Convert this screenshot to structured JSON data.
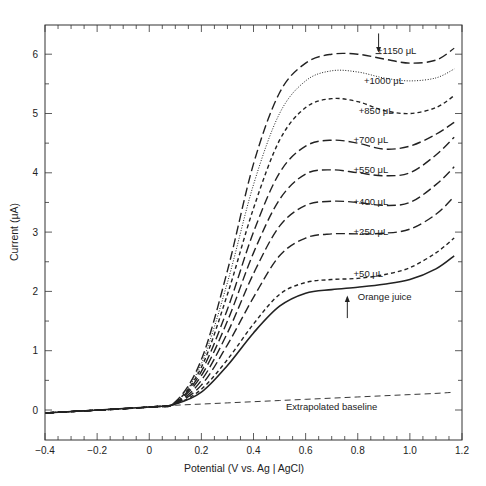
{
  "chart_data": {
    "type": "line",
    "title": "",
    "xlabel": "Potential (V vs. Ag | AgCl)",
    "ylabel": "Current (μA)",
    "xlim": [
      -0.4,
      1.2
    ],
    "ylim": [
      -0.35,
      6.45
    ],
    "xticks": [
      "-0.4",
      "-0.2",
      "0",
      "0.2",
      "0.4",
      "0.6",
      "0.8",
      "1.0",
      "1.2"
    ],
    "yticks": [
      "0",
      "1",
      "2",
      "3",
      "4",
      "5",
      "6"
    ],
    "grid": false,
    "x": [
      -0.4,
      0.0,
      0.1,
      0.2,
      0.3,
      0.4,
      0.5,
      0.6,
      0.7,
      0.8,
      0.9,
      1.0,
      1.1,
      1.17
    ],
    "series": [
      {
        "name": "Orange juice",
        "style": "solid",
        "values": [
          -0.05,
          0.05,
          0.1,
          0.3,
          0.75,
          1.3,
          1.75,
          1.97,
          2.03,
          2.07,
          2.12,
          2.2,
          2.38,
          2.6
        ]
      },
      {
        "name": "+50 μL",
        "style": "short-dash",
        "values": [
          -0.05,
          0.05,
          0.1,
          0.35,
          0.85,
          1.45,
          1.95,
          2.15,
          2.2,
          2.22,
          2.28,
          2.4,
          2.65,
          2.9
        ]
      },
      {
        "name": "+250 μL",
        "style": "long-dash",
        "values": [
          -0.05,
          0.05,
          0.11,
          0.42,
          1.1,
          1.9,
          2.6,
          2.9,
          2.97,
          2.97,
          2.98,
          3.05,
          3.3,
          3.6
        ]
      },
      {
        "name": "+400 μL",
        "style": "long-dash",
        "values": [
          -0.05,
          0.05,
          0.11,
          0.5,
          1.3,
          2.3,
          3.1,
          3.45,
          3.52,
          3.5,
          3.45,
          3.5,
          3.8,
          4.1
        ]
      },
      {
        "name": "+550 μL",
        "style": "long-dash",
        "values": [
          -0.05,
          0.05,
          0.12,
          0.58,
          1.5,
          2.65,
          3.55,
          3.98,
          4.05,
          4.0,
          3.95,
          4.0,
          4.3,
          4.6
        ]
      },
      {
        "name": "+700 μL",
        "style": "long-dash",
        "values": [
          -0.05,
          0.05,
          0.12,
          0.65,
          1.7,
          3.0,
          4.0,
          4.45,
          4.55,
          4.5,
          4.4,
          4.45,
          4.65,
          4.85
        ]
      },
      {
        "name": "+850 μL",
        "style": "short-dash",
        "values": [
          -0.05,
          0.05,
          0.13,
          0.72,
          1.95,
          3.4,
          4.55,
          5.1,
          5.25,
          5.2,
          5.05,
          5.0,
          5.1,
          5.3
        ]
      },
      {
        "name": "+1000 μL",
        "style": "dotted",
        "values": [
          -0.05,
          0.05,
          0.13,
          0.78,
          2.15,
          3.8,
          5.0,
          5.55,
          5.72,
          5.7,
          5.6,
          5.55,
          5.6,
          5.75
        ]
      },
      {
        "name": "+1150 μL",
        "style": "long-dash",
        "values": [
          -0.05,
          0.05,
          0.14,
          0.85,
          2.35,
          4.15,
          5.35,
          5.85,
          6.0,
          6.0,
          5.92,
          5.85,
          5.9,
          6.1
        ]
      },
      {
        "name": "Extrapolated baseline",
        "style": "dashed",
        "values": [
          -0.05,
          0.05,
          0.08,
          0.1,
          0.12,
          0.14,
          0.16,
          0.18,
          0.2,
          0.22,
          0.24,
          0.26,
          0.28,
          0.3
        ]
      }
    ],
    "annotations": [
      {
        "text": "+1150 μL",
        "x": 0.92,
        "y": 6.05,
        "arrow": "down at 0.88"
      },
      {
        "text": "+1000 μL",
        "x": 0.87,
        "y": 5.55
      },
      {
        "text": "+850 μL",
        "x": 0.85,
        "y": 5.05
      },
      {
        "text": "+700 μL",
        "x": 0.83,
        "y": 4.55
      },
      {
        "text": "+550 μL",
        "x": 0.83,
        "y": 4.05
      },
      {
        "text": "+400 μL",
        "x": 0.83,
        "y": 3.5
      },
      {
        "text": "+250 μL",
        "x": 0.83,
        "y": 3.0
      },
      {
        "text": "+50 μL",
        "x": 0.83,
        "y": 2.3
      },
      {
        "text": "Orange juice",
        "x": 0.8,
        "y": 1.9,
        "arrow": "up at 0.77"
      },
      {
        "text": "Extrapolated baseline",
        "x": 0.7,
        "y": 0.05
      }
    ]
  }
}
